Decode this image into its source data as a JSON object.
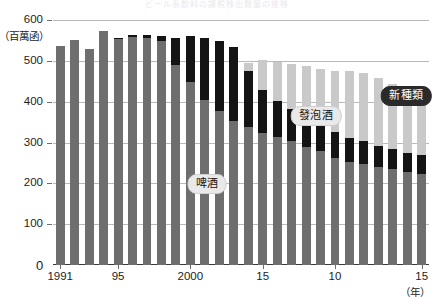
{
  "chart_data": {
    "type": "bar",
    "stacked": true,
    "title": "ビール系飲料の課税移出数量の推移",
    "unit_label": "（百萬函）",
    "xlabel": "（年）",
    "ylabel": "",
    "ylim": [
      0,
      600
    ],
    "yticks": [
      0,
      100,
      200,
      300,
      400,
      500,
      600
    ],
    "grid": true,
    "legend_position": "in-plot",
    "categories": [
      "1991",
      "1992",
      "1993",
      "1994",
      "1995",
      "1996",
      "1997",
      "1998",
      "1999",
      "2000",
      "2001",
      "2002",
      "2003",
      "2004",
      "2005",
      "2006",
      "2007",
      "2008",
      "2009",
      "2010",
      "2011",
      "2012",
      "2013",
      "2014",
      "2015",
      "2016"
    ],
    "xtick_labels": [
      {
        "index": 0,
        "text": "1991"
      },
      {
        "index": 4,
        "text": "95"
      },
      {
        "index": 9,
        "text": "2000"
      },
      {
        "index": 14,
        "text": "15"
      },
      {
        "index": 19,
        "text": "10"
      },
      {
        "index": 25,
        "text": "15"
      }
    ],
    "series": [
      {
        "name": "啤酒",
        "color": "#6e6e6e",
        "values": [
          537,
          551,
          530,
          574,
          553,
          559,
          555,
          548,
          490,
          449,
          404,
          377,
          352,
          338,
          324,
          314,
          303,
          290,
          278,
          263,
          253,
          248,
          240,
          234,
          228,
          224
        ]
      },
      {
        "name": "發泡酒",
        "color": "#141414",
        "values": [
          0,
          0,
          0,
          0,
          2,
          5,
          9,
          13,
          67,
          111,
          152,
          172,
          181,
          137,
          105,
          88,
          79,
          74,
          67,
          62,
          58,
          55,
          52,
          49,
          47,
          45
        ]
      },
      {
        "name": "新種類",
        "color": "#c9c9c9",
        "values": [
          0,
          0,
          0,
          0,
          0,
          0,
          0,
          0,
          0,
          0,
          0,
          0,
          0,
          20,
          73,
          94,
          110,
          124,
          136,
          151,
          163,
          167,
          165,
          161,
          158,
          157
        ]
      }
    ],
    "annotations": [
      {
        "name": "啤酒",
        "x_pct": 41.0,
        "y_pct": 67.0,
        "style": "light"
      },
      {
        "name": "發泡酒",
        "x_pct": 70.0,
        "y_pct": 39.0,
        "style": "light"
      },
      {
        "name": "新種類",
        "x_pct": 94.0,
        "y_pct": 31.0,
        "style": "dark"
      }
    ]
  }
}
